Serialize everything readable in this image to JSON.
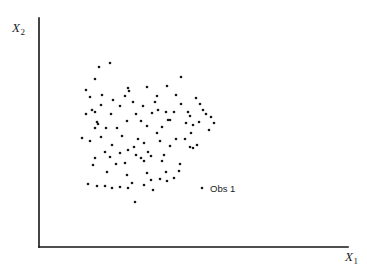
{
  "figure": {
    "width": 367,
    "height": 276,
    "background": "#ffffff",
    "ink_color": "#161616"
  },
  "axes": {
    "x_label_text": "X",
    "x_label_sub": "1",
    "y_label_text": "X",
    "y_label_sub": "2",
    "origin_px": [
      39,
      247
    ],
    "x_axis_end_px": [
      348,
      247
    ],
    "y_axis_top_px": [
      39,
      18
    ],
    "line_width": 1.6,
    "ticks": false,
    "grid": false
  },
  "annotations": [
    {
      "name": "obs-1",
      "label": "Obs 1",
      "marker_px": [
        202,
        188
      ],
      "label_px": [
        210,
        184
      ]
    }
  ],
  "chart_data": {
    "type": "scatter",
    "title": "",
    "xlabel": "X1",
    "ylabel": "X2",
    "xlim": [
      39,
      348
    ],
    "ylim": [
      18,
      247
    ],
    "grid": false,
    "legend": null,
    "marker": {
      "shape": "circle",
      "size_px": 2.6,
      "color": "#161616"
    },
    "series": [
      {
        "name": "observations",
        "note": "Point coordinates given in image pixel space (origin top-left).",
        "points_px": [
          [
            110,
            63
          ],
          [
            99,
            67
          ],
          [
            95,
            79
          ],
          [
            181,
            77
          ],
          [
            147,
            87
          ],
          [
            167,
            86
          ],
          [
            86,
            90
          ],
          [
            128,
            88
          ],
          [
            129,
            91
          ],
          [
            102,
            95
          ],
          [
            125,
            96
          ],
          [
            157,
            96
          ],
          [
            90,
            97
          ],
          [
            113,
            100
          ],
          [
            155,
            102
          ],
          [
            133,
            102
          ],
          [
            176,
            95
          ],
          [
            196,
            98
          ],
          [
            92,
            110
          ],
          [
            95,
            112
          ],
          [
            101,
            105
          ],
          [
            120,
            106
          ],
          [
            143,
            106
          ],
          [
            158,
            110
          ],
          [
            181,
            104
          ],
          [
            200,
            104
          ],
          [
            86,
            114
          ],
          [
            111,
            114
          ],
          [
            136,
            114
          ],
          [
            152,
            113
          ],
          [
            166,
            112
          ],
          [
            174,
            112
          ],
          [
            188,
            112
          ],
          [
            203,
            110
          ],
          [
            97,
            122
          ],
          [
            98,
            124
          ],
          [
            127,
            121
          ],
          [
            141,
            121
          ],
          [
            168,
            120
          ],
          [
            170,
            120
          ],
          [
            190,
            116
          ],
          [
            206,
            114
          ],
          [
            211,
            117
          ],
          [
            95,
            128
          ],
          [
            106,
            128
          ],
          [
            117,
            128
          ],
          [
            147,
            126
          ],
          [
            162,
            127
          ],
          [
            186,
            123
          ],
          [
            193,
            125
          ],
          [
            199,
            122
          ],
          [
            214,
            123
          ],
          [
            82,
            138
          ],
          [
            101,
            137
          ],
          [
            122,
            136
          ],
          [
            138,
            139
          ],
          [
            157,
            133
          ],
          [
            160,
            141
          ],
          [
            191,
            133
          ],
          [
            209,
            130
          ],
          [
            90,
            141
          ],
          [
            112,
            145
          ],
          [
            134,
            147
          ],
          [
            144,
            143
          ],
          [
            176,
            139
          ],
          [
            185,
            139
          ],
          [
            105,
            152
          ],
          [
            120,
            153
          ],
          [
            128,
            150
          ],
          [
            148,
            152
          ],
          [
            170,
            146
          ],
          [
            197,
            145
          ],
          [
            95,
            158
          ],
          [
            110,
            157
          ],
          [
            136,
            155
          ],
          [
            141,
            158
          ],
          [
            151,
            156
          ],
          [
            164,
            155
          ],
          [
            190,
            147
          ],
          [
            193,
            148
          ],
          [
            93,
            165
          ],
          [
            116,
            164
          ],
          [
            125,
            163
          ],
          [
            144,
            161
          ],
          [
            162,
            161
          ],
          [
            180,
            164
          ],
          [
            107,
            172
          ],
          [
            127,
            175
          ],
          [
            147,
            173
          ],
          [
            166,
            172
          ],
          [
            179,
            171
          ],
          [
            88,
            184
          ],
          [
            97,
            186
          ],
          [
            105,
            186
          ],
          [
            112,
            188
          ],
          [
            120,
            187
          ],
          [
            128,
            188
          ],
          [
            132,
            183
          ],
          [
            144,
            185
          ],
          [
            151,
            180
          ],
          [
            153,
            190
          ],
          [
            160,
            179
          ],
          [
            167,
            181
          ],
          [
            174,
            178
          ],
          [
            135,
            202
          ]
        ]
      }
    ]
  }
}
